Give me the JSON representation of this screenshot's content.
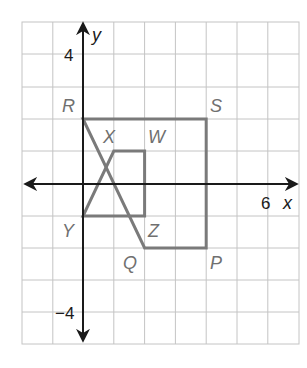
{
  "diagram": {
    "type": "coordinate-plane",
    "grid": {
      "x_min": -2,
      "x_max": 7,
      "y_min": -5,
      "y_max": 5,
      "origin_px": [
        83,
        184
      ],
      "cell_px": [
        30.8,
        32.2
      ]
    },
    "axes": {
      "x_label": "x",
      "y_label": "y",
      "tick_labels": [
        {
          "text": "4",
          "axis": "y",
          "value": 4
        },
        {
          "text": "−4",
          "axis": "y",
          "value": -4
        },
        {
          "text": "6",
          "axis": "x",
          "value": 6
        }
      ]
    },
    "figures": [
      {
        "name": "RSPQ",
        "vertices": [
          {
            "label": "R",
            "x": 0,
            "y": 2
          },
          {
            "label": "S",
            "x": 4,
            "y": 2
          },
          {
            "label": "P",
            "x": 4,
            "y": -2
          },
          {
            "label": "Q",
            "x": 2,
            "y": -2
          }
        ]
      },
      {
        "name": "XWZY",
        "vertices": [
          {
            "label": "X",
            "x": 1,
            "y": 1
          },
          {
            "label": "W",
            "x": 2,
            "y": 1
          },
          {
            "label": "Z",
            "x": 2,
            "y": -1
          },
          {
            "label": "Y",
            "x": 0,
            "y": -1
          }
        ]
      }
    ],
    "colors": {
      "shape_stroke": "#7a7a7a",
      "axis": "#1a1a1a",
      "grid": "#c4c4c4",
      "vertex_label": "#707070"
    }
  }
}
